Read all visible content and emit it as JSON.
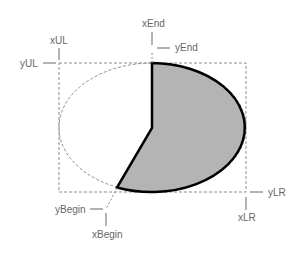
{
  "diagram": {
    "type": "pie-geometry",
    "labels": {
      "xUL": "xUL",
      "yUL": "yUL",
      "xEnd": "xEnd",
      "yEnd": "yEnd",
      "xLR": "xLR",
      "yLR": "yLR",
      "xBegin": "xBegin",
      "yBegin": "yBegin"
    },
    "colors": {
      "pie_fill": "#b4b4b4",
      "pie_stroke": "#000000",
      "guide": "#8c8c8c",
      "label": "#666666"
    }
  }
}
